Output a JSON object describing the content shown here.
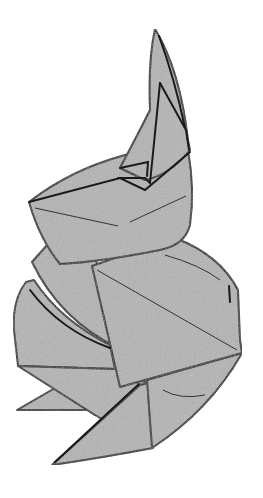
{
  "figure": {
    "colors": {
      "paper": "#b4b4b4",
      "outline": "#1a1a1a",
      "background": "#ffffff"
    }
  }
}
